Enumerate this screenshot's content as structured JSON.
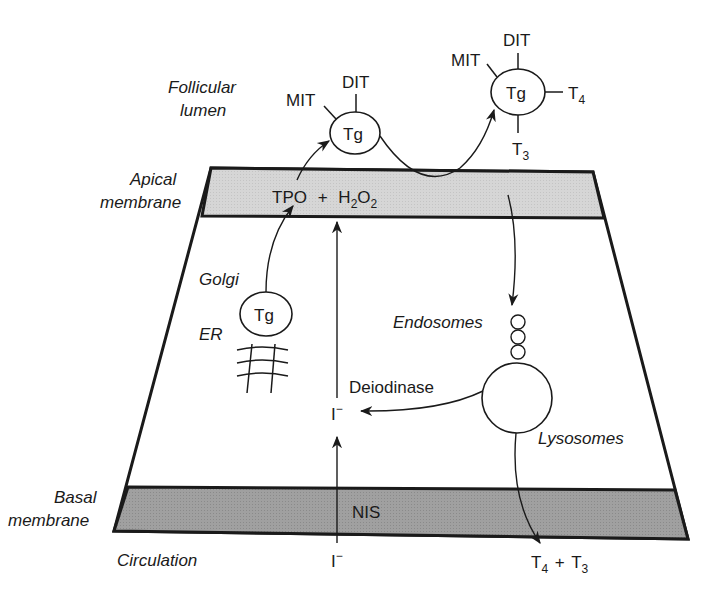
{
  "diagram": {
    "colors": {
      "ink": "#1a1a1a",
      "apical_fill": "#d4d4d4",
      "basal_fill": "#9e9e9e",
      "background": "#ffffff"
    },
    "region_labels": {
      "follicular_lumen_1": "Follicular",
      "follicular_lumen_2": "lumen",
      "apical_membrane_1": "Apical",
      "apical_membrane_2": "membrane",
      "basal_membrane_1": "Basal",
      "basal_membrane_2": "membrane",
      "circulation": "Circulation"
    },
    "organelles": {
      "golgi": "Golgi",
      "er": "ER",
      "endosomes": "Endosomes",
      "lysosomes": "Lysosomes"
    },
    "tg_secreted": {
      "center": "Tg",
      "mit": "MIT",
      "dit": "DIT"
    },
    "tg_iodinated": {
      "center": "Tg",
      "mit": "MIT",
      "dit": "DIT",
      "t4_base": "T",
      "t4_sub": "4",
      "t3_base": "T",
      "t3_sub": "3"
    },
    "tg_cell": "Tg",
    "apical_enzyme": {
      "tpo": "TPO",
      "plus": "+",
      "h2o2_h": "H",
      "h2o2_sub1": "2",
      "h2o2_o": "O",
      "h2o2_sub2": "2"
    },
    "basal_transporter": "NIS",
    "iodide_cell": "I",
    "iodide_cell_charge": "−",
    "iodide_circ": "I",
    "iodide_circ_charge": "−",
    "deiodinase": "Deiodinase",
    "output": {
      "t4_base": "T",
      "t4_sub": "4",
      "plus": "+",
      "t3_base": "T",
      "t3_sub": "3"
    }
  }
}
